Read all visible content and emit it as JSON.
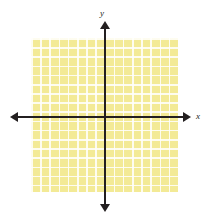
{
  "chart_data": {
    "type": "scatter",
    "title": "",
    "subtitle": "",
    "xlabel": "x",
    "ylabel": "y",
    "x": [],
    "y": [],
    "series": [],
    "annotations": [],
    "legend": [],
    "legend_position": "none",
    "grid": true,
    "grid_columns": 16,
    "grid_rows": 17,
    "xlim": [
      -8,
      8
    ],
    "ylim": [
      -9,
      8
    ],
    "xticks": [],
    "yticks": [],
    "tick_labels_shown": false
  },
  "figure": {
    "x_axis_label": "x",
    "y_axis_label": "y",
    "colors": {
      "grid_fill": "#f3ea96",
      "grid_line": "#fffffc",
      "axis": "#231f20",
      "background": "#ffffff"
    }
  }
}
